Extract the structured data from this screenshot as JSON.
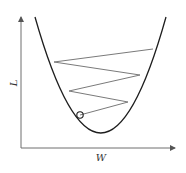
{
  "diagram": {
    "type": "gradient-descent-illustration",
    "axes": {
      "x_label": "W",
      "y_label": "L"
    },
    "curve": {
      "description": "convex loss curve (parabola)",
      "left_top": [
        35,
        17
      ],
      "minimum": [
        101,
        133
      ],
      "right_top": [
        166,
        17
      ]
    },
    "zigzag_points": [
      [
        153,
        49
      ],
      [
        54,
        62
      ],
      [
        140,
        75
      ],
      [
        69,
        91
      ],
      [
        128,
        102
      ],
      [
        80,
        115
      ]
    ],
    "current_point_marker": {
      "shape": "circle",
      "position": [
        80,
        115
      ]
    },
    "colors": {
      "curve": "#1e1e1e",
      "axes": "#6e6e6e",
      "steps": "#7a7a7a",
      "background": "#ffffff"
    }
  }
}
